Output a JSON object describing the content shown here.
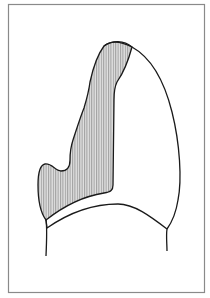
{
  "figure": {
    "colors": {
      "background": "#ffffff",
      "frame": "#8a8a8a",
      "outline": "#1a1a1a",
      "hatch": "#6e6e6e",
      "hatch_fill": "#d4d4d4"
    }
  }
}
